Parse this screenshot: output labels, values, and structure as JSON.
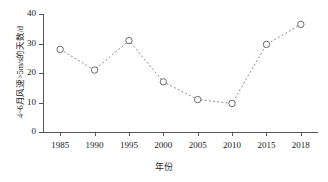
{
  "chart_data": {
    "type": "line",
    "title": "",
    "xlabel": "年份",
    "ylabel": "4~6月风速>5m/s的天数/d",
    "categories": [
      "1985",
      "1990",
      "1995",
      "2000",
      "2005",
      "2010",
      "2015",
      "2018"
    ],
    "values": [
      28,
      21,
      31,
      17,
      11,
      9.7,
      29.7,
      36.5
    ],
    "series": [
      {
        "name": "4~6月风速>5m/s的天数",
        "values": [
          28,
          21,
          31,
          17,
          11,
          9.7,
          29.7,
          36.5
        ]
      }
    ],
    "ylim": [
      0,
      40
    ],
    "yticks": [
      0,
      10,
      20,
      30,
      40
    ],
    "ytick_labels": [
      "0",
      "10",
      "20",
      "30",
      "40"
    ],
    "grid": false,
    "legend": false,
    "line_style": "dotted",
    "marker": "open-circle",
    "line_color": "#8c8c8c",
    "marker_color": "#595959"
  }
}
